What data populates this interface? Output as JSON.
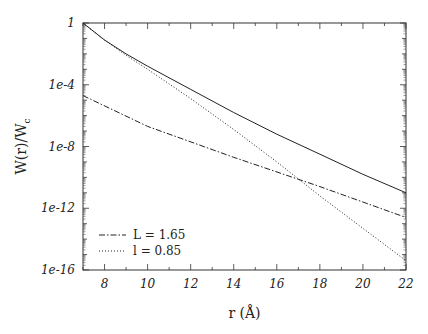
{
  "chart_data": {
    "type": "line",
    "title": "",
    "xlabel": "r (Å)",
    "ylabel": "W(r)/W_c",
    "xlim": [
      7,
      22
    ],
    "ylim_log10": [
      -16,
      0
    ],
    "yscale": "log",
    "grid": false,
    "legend_position": "lower left",
    "x_ticks": [
      8,
      10,
      12,
      14,
      16,
      18,
      20,
      22
    ],
    "x_tick_labels": [
      "8",
      "10",
      "12",
      "14",
      "16",
      "18",
      "20",
      "22"
    ],
    "y_ticks_log10": [
      0,
      -4,
      -8,
      -12,
      -16
    ],
    "y_tick_labels": [
      "1",
      "1e-4",
      "1e-8",
      "1e-12",
      "1e-16"
    ],
    "series": [
      {
        "name": "total (solid)",
        "style": "solid",
        "legend": false,
        "x": [
          7,
          8,
          9,
          10,
          12,
          14,
          16,
          18,
          20,
          22
        ],
        "log10_y": [
          0,
          -1.1,
          -2.0,
          -2.8,
          -4.3,
          -5.8,
          -7.2,
          -8.5,
          -9.8,
          -11.0
        ]
      },
      {
        "name": "L = 1.65",
        "style": "dashdot",
        "legend": true,
        "x": [
          7,
          10,
          14,
          18,
          22
        ],
        "log10_y": [
          -4.7,
          -6.7,
          -8.7,
          -10.6,
          -12.6
        ]
      },
      {
        "name": "l = 0.85",
        "style": "dotted",
        "legend": true,
        "x": [
          7,
          8,
          9,
          10,
          12,
          14,
          16,
          18,
          20,
          22
        ],
        "log10_y": [
          0,
          -1.1,
          -2.1,
          -3.0,
          -4.9,
          -6.9,
          -9.0,
          -11.2,
          -13.3,
          -15.4
        ]
      }
    ]
  },
  "legend": {
    "items": [
      {
        "label": "L = 1.65",
        "style": "dashdot"
      },
      {
        "label": "l = 0.85",
        "style": "dotted"
      }
    ]
  },
  "axes": {
    "xlabel": "r (Å)",
    "ylabel_main": "W(r)/W",
    "ylabel_sub": "c"
  }
}
